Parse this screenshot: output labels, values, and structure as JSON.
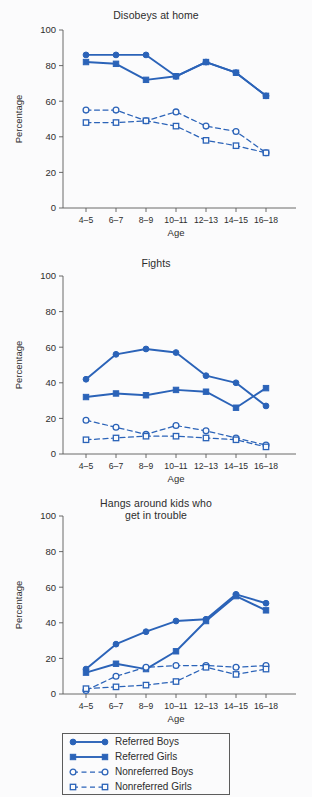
{
  "figure": {
    "background_color": "#fbfbfc",
    "series_color": "#2b63b8",
    "axis_color": "#5a5a5a"
  },
  "axes": {
    "ylabel": "Percentage",
    "xlabel": "Age",
    "yticks": [
      "100",
      "80",
      "60",
      "40",
      "20",
      "0"
    ],
    "ylim": [
      0,
      100
    ],
    "categories": [
      "4–5",
      "6–7",
      "8–9",
      "10–11",
      "12–13",
      "14–15",
      "16–18"
    ]
  },
  "legend": {
    "items": [
      {
        "label": "Referred Boys",
        "marker": "filled-circle",
        "line": "solid"
      },
      {
        "label": "Referred Girls",
        "marker": "filled-square",
        "line": "solid"
      },
      {
        "label": "Nonreferred Boys",
        "marker": "open-circle",
        "line": "dashed"
      },
      {
        "label": "Nonreferred Girls",
        "marker": "open-square",
        "line": "dashed"
      }
    ]
  },
  "chart_data": [
    {
      "type": "line",
      "title": "Disobeys at home",
      "xlabel": "Age",
      "ylabel": "Percentage",
      "ylim": [
        0,
        100
      ],
      "yticks": [
        0,
        20,
        40,
        60,
        80,
        100
      ],
      "grid": false,
      "legend_position": "below-figure",
      "categories": [
        "4–5",
        "6–7",
        "8–9",
        "10–11",
        "12–13",
        "14–15",
        "16–18"
      ],
      "series": [
        {
          "name": "Referred Boys",
          "marker": "filled-circle",
          "line": "solid",
          "values": [
            86,
            86,
            86,
            74,
            82,
            76,
            63
          ]
        },
        {
          "name": "Referred Girls",
          "marker": "filled-square",
          "line": "solid",
          "values": [
            82,
            81,
            72,
            74,
            82,
            76,
            63
          ]
        },
        {
          "name": "Nonreferred Boys",
          "marker": "open-circle",
          "line": "dashed",
          "values": [
            55,
            55,
            49,
            54,
            46,
            43,
            31
          ]
        },
        {
          "name": "Nonreferred Girls",
          "marker": "open-square",
          "line": "dashed",
          "values": [
            48,
            48,
            49,
            46,
            38,
            35,
            31
          ]
        }
      ]
    },
    {
      "type": "line",
      "title": "Fights",
      "xlabel": "Age",
      "ylabel": "Percentage",
      "ylim": [
        0,
        100
      ],
      "yticks": [
        0,
        20,
        40,
        60,
        80,
        100
      ],
      "grid": false,
      "legend_position": "below-figure",
      "categories": [
        "4–5",
        "6–7",
        "8–9",
        "10–11",
        "12–13",
        "14–15",
        "16–18"
      ],
      "series": [
        {
          "name": "Referred Boys",
          "marker": "filled-circle",
          "line": "solid",
          "values": [
            42,
            56,
            59,
            57,
            44,
            40,
            27
          ]
        },
        {
          "name": "Referred Girls",
          "marker": "filled-square",
          "line": "solid",
          "values": [
            32,
            34,
            33,
            36,
            35,
            26,
            37
          ]
        },
        {
          "name": "Nonreferred Boys",
          "marker": "open-circle",
          "line": "dashed",
          "values": [
            19,
            15,
            11,
            16,
            13,
            9,
            5
          ]
        },
        {
          "name": "Nonreferred Girls",
          "marker": "open-square",
          "line": "dashed",
          "values": [
            8,
            9,
            10,
            10,
            9,
            8,
            4
          ]
        }
      ]
    },
    {
      "type": "line",
      "title": "Hangs around kids who\nget in trouble",
      "xlabel": "Age",
      "ylabel": "Percentage",
      "ylim": [
        0,
        100
      ],
      "yticks": [
        0,
        20,
        40,
        60,
        80,
        100
      ],
      "grid": false,
      "legend_position": "below-figure",
      "categories": [
        "4–5",
        "6–7",
        "8–9",
        "10–11",
        "12–13",
        "14–15",
        "16–18"
      ],
      "series": [
        {
          "name": "Referred Boys",
          "marker": "filled-circle",
          "line": "solid",
          "values": [
            14,
            28,
            35,
            41,
            42,
            56,
            51
          ]
        },
        {
          "name": "Referred Girls",
          "marker": "filled-square",
          "line": "solid",
          "values": [
            12,
            17,
            14,
            24,
            41,
            55,
            47
          ]
        },
        {
          "name": "Nonreferred Boys",
          "marker": "open-circle",
          "line": "dashed",
          "values": [
            2,
            10,
            15,
            16,
            16,
            15,
            16
          ]
        },
        {
          "name": "Nonreferred Girls",
          "marker": "open-square",
          "line": "dashed",
          "values": [
            3,
            4,
            5,
            7,
            15,
            11,
            14
          ]
        }
      ]
    }
  ]
}
